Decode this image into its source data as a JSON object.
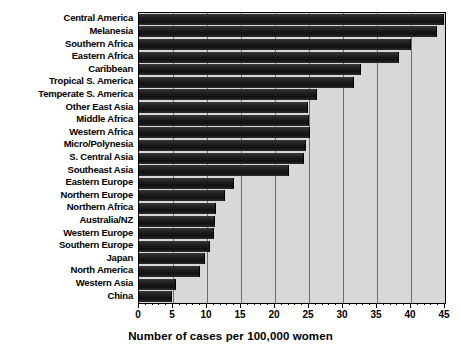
{
  "chart_data": {
    "type": "bar",
    "orientation": "horizontal",
    "title": "",
    "xlabel": "Number of cases per 100,000 women",
    "ylabel": "",
    "xlim": [
      0,
      45
    ],
    "xticks": [
      0,
      5,
      10,
      15,
      20,
      25,
      30,
      35,
      40,
      45
    ],
    "grid": true,
    "legend": null,
    "categories": [
      "Central America",
      "Melanesia",
      "Southern Africa",
      "Eastern Africa",
      "Caribbean",
      "Tropical S. America",
      "Temperate S. America",
      "Other East Asia",
      "Middle Africa",
      "Western Africa",
      "Micro/Polynesia",
      "S. Central Asia",
      "Southeast Asia",
      "Eastern Europe",
      "Northern Europe",
      "Northern Africa",
      "Australia/NZ",
      "Western Europe",
      "Southern Europe",
      "Japan",
      "North America",
      "Western Asia",
      "China"
    ],
    "values": [
      44.8,
      43.8,
      40.0,
      38.2,
      32.6,
      31.6,
      26.2,
      24.9,
      25.0,
      25.1,
      24.6,
      24.2,
      22.0,
      13.9,
      12.6,
      11.3,
      11.2,
      11.0,
      10.5,
      9.7,
      9.0,
      5.4,
      4.9
    ],
    "colors": {
      "bar": "#1a1a1a",
      "plot_background": "#d8d8d8",
      "gridline": "#6e6e6e",
      "axis": "#000000",
      "text": "#000000",
      "page_background": "#ffffff"
    }
  }
}
